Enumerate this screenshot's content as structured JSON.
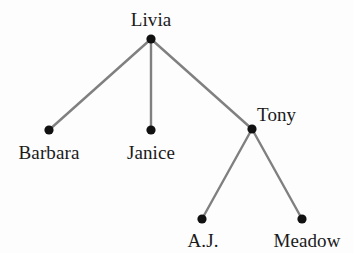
{
  "diagram": {
    "type": "tree",
    "background_color": "#fdfdfd",
    "edge_color": "#808080",
    "node_color": "#111111",
    "label_color": "#1a1a1a",
    "edge_width": 2.4,
    "node_radius": 4.6,
    "canvas": {
      "width": 354,
      "height": 253
    },
    "nodes": [
      {
        "id": "livia",
        "label": "Livia",
        "x": 151,
        "y": 39,
        "label_x": 151,
        "label_y": 10,
        "label_align": "center"
      },
      {
        "id": "barbara",
        "label": "Barbara",
        "x": 49,
        "y": 130,
        "label_x": 49,
        "label_y": 143,
        "label_align": "center"
      },
      {
        "id": "janice",
        "label": "Janice",
        "x": 151,
        "y": 130,
        "label_x": 151,
        "label_y": 143,
        "label_align": "center"
      },
      {
        "id": "tony",
        "label": "Tony",
        "x": 252,
        "y": 129,
        "label_x": 257,
        "label_y": 105,
        "label_align": "left"
      },
      {
        "id": "aj",
        "label": "A.J.",
        "x": 202,
        "y": 219,
        "label_x": 203,
        "label_y": 231,
        "label_align": "center"
      },
      {
        "id": "meadow",
        "label": "Meadow",
        "x": 302,
        "y": 219,
        "label_x": 307,
        "label_y": 231,
        "label_align": "center"
      }
    ],
    "edges": [
      {
        "id": "livia-barbara",
        "from": "livia",
        "to": "barbara",
        "x1": 151,
        "y1": 39,
        "x2": 49,
        "y2": 130
      },
      {
        "id": "livia-janice",
        "from": "livia",
        "to": "janice",
        "x1": 151,
        "y1": 39,
        "x2": 151,
        "y2": 130
      },
      {
        "id": "livia-tony",
        "from": "livia",
        "to": "tony",
        "x1": 151,
        "y1": 39,
        "x2": 252,
        "y2": 129
      },
      {
        "id": "tony-aj",
        "from": "tony",
        "to": "aj",
        "x1": 252,
        "y1": 129,
        "x2": 202,
        "y2": 219
      },
      {
        "id": "tony-meadow",
        "from": "tony",
        "to": "meadow",
        "x1": 252,
        "y1": 129,
        "x2": 302,
        "y2": 219
      }
    ]
  }
}
